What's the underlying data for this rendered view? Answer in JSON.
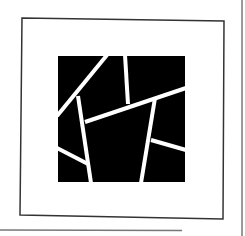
{
  "canvas": {
    "width": 245,
    "height": 236,
    "background": "#ffffff"
  },
  "colors": {
    "frame_stroke": "#333333",
    "outer_line_stroke": "#777777",
    "square_fill": "#000000",
    "divider_stroke": "#ffffff"
  },
  "frame": {
    "points": "22,18 224,21 223,219 20,215"
  },
  "outer_lines": [
    {
      "name": "right-outer-line",
      "x1": 242,
      "y1": 0,
      "x2": 242,
      "y2": 236
    },
    {
      "name": "bottom-outer-line",
      "x1": 0,
      "y1": 230,
      "x2": 182,
      "y2": 230.5
    }
  ],
  "black_square": {
    "x": 58,
    "y": 56,
    "width": 127,
    "height": 126
  },
  "dividers": [
    {
      "name": "diagonal-top-left",
      "x1": 107,
      "y1": 55,
      "x2": 57,
      "y2": 116
    },
    {
      "name": "left-inner-slant",
      "x1": 78,
      "y1": 96,
      "x2": 91,
      "y2": 183
    },
    {
      "name": "top-vertical",
      "x1": 125,
      "y1": 55,
      "x2": 128,
      "y2": 104
    },
    {
      "name": "long-cross-line",
      "x1": 85,
      "y1": 122,
      "x2": 186,
      "y2": 88
    },
    {
      "name": "right-inner-slant",
      "x1": 155,
      "y1": 98,
      "x2": 141,
      "y2": 183
    },
    {
      "name": "lower-left-spur",
      "x1": 57,
      "y1": 148,
      "x2": 88,
      "y2": 164
    },
    {
      "name": "lower-right-spur",
      "x1": 151,
      "y1": 140,
      "x2": 186,
      "y2": 150
    }
  ],
  "divider_width": 4
}
